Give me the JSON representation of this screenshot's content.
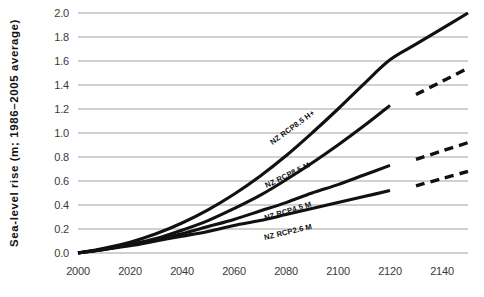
{
  "chart_data": {
    "type": "line",
    "title": "",
    "xlabel": "",
    "ylabel": "Sea-level rise (m; 1986–2005 average)",
    "xlim": [
      2000,
      2150
    ],
    "ylim": [
      0.0,
      2.0
    ],
    "grid": true,
    "legend_position": "inline-labels",
    "xticks": [
      "2000",
      "2020",
      "2040",
      "2060",
      "2080",
      "2100",
      "2120",
      "2140"
    ],
    "xtick_values": [
      2000,
      2020,
      2040,
      2060,
      2080,
      2100,
      2120,
      2140
    ],
    "yticks": [
      "0.0",
      "0.2",
      "0.4",
      "0.6",
      "0.8",
      "1.0",
      "1.2",
      "1.4",
      "1.6",
      "1.8",
      "2.0"
    ],
    "ytick_values": [
      0.0,
      0.2,
      0.4,
      0.6,
      0.8,
      1.0,
      1.2,
      1.4,
      1.6,
      1.8,
      2.0
    ],
    "series": [
      {
        "name": "NZ RCP8.5 H+",
        "style": "solid",
        "x": [
          2000,
          2010,
          2020,
          2030,
          2040,
          2050,
          2060,
          2070,
          2080,
          2090,
          2100,
          2110,
          2120,
          2130,
          2140,
          2150
        ],
        "values": [
          0.0,
          0.04,
          0.09,
          0.16,
          0.25,
          0.36,
          0.49,
          0.64,
          0.81,
          1.0,
          1.2,
          1.41,
          1.61,
          1.74,
          1.87,
          2.0
        ]
      },
      {
        "name": "NZ RCP8.5 M",
        "style": "solid",
        "x": [
          2000,
          2010,
          2020,
          2030,
          2040,
          2050,
          2060,
          2070,
          2080,
          2090,
          2100,
          2110,
          2120
        ],
        "values": [
          0.0,
          0.03,
          0.07,
          0.12,
          0.19,
          0.27,
          0.37,
          0.48,
          0.61,
          0.75,
          0.9,
          1.06,
          1.23
        ]
      },
      {
        "name": "NZ RCP4.5 M",
        "style": "solid",
        "x": [
          2000,
          2010,
          2020,
          2030,
          2040,
          2050,
          2060,
          2070,
          2080,
          2090,
          2100,
          2110,
          2120
        ],
        "values": [
          0.0,
          0.03,
          0.07,
          0.11,
          0.16,
          0.22,
          0.28,
          0.35,
          0.42,
          0.5,
          0.57,
          0.65,
          0.73
        ]
      },
      {
        "name": "NZ RCP2.6 M",
        "style": "solid",
        "x": [
          2000,
          2010,
          2020,
          2030,
          2040,
          2050,
          2060,
          2070,
          2080,
          2090,
          2100,
          2110,
          2120
        ],
        "values": [
          0.0,
          0.03,
          0.06,
          0.1,
          0.14,
          0.18,
          0.23,
          0.27,
          0.32,
          0.37,
          0.42,
          0.47,
          0.52
        ]
      }
    ],
    "dashed_extensions": [
      {
        "name": "NZ RCP8.5 M extension",
        "style": "dashed",
        "x": [
          2130,
          2140,
          2150
        ],
        "values": [
          1.32,
          1.43,
          1.54
        ]
      },
      {
        "name": "NZ RCP4.5 M extension",
        "style": "dashed",
        "x": [
          2130,
          2140,
          2150
        ],
        "values": [
          0.78,
          0.85,
          0.92
        ]
      },
      {
        "name": "NZ RCP2.6 M extension",
        "style": "dashed",
        "x": [
          2130,
          2140,
          2150
        ],
        "values": [
          0.56,
          0.62,
          0.68
        ]
      }
    ],
    "annotations": [
      {
        "text": "NZ RCP8.5 H+",
        "x": 2083,
        "y": 1.03,
        "rotation": -36
      },
      {
        "text": "NZ RCP8.5 M",
        "x": 2081,
        "y": 0.63,
        "rotation": -26
      },
      {
        "text": "NZ RCP4.5 M",
        "x": 2081,
        "y": 0.33,
        "rotation": -17
      },
      {
        "text": "NZ RCP2.6 M",
        "x": 2081,
        "y": 0.155,
        "rotation": -13
      }
    ],
    "colors": {
      "line": "#111111",
      "grid": "#8c8c8c",
      "tick_text": "#3a3a3a",
      "axis_title": "#111111",
      "background": "#ffffff"
    }
  }
}
